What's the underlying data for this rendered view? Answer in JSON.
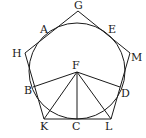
{
  "diagram": {
    "stroke_color": "#1a1a1a",
    "background": "#ffffff",
    "circle": {
      "center": [
        77,
        71
      ],
      "radius": 48
    },
    "pentagon": {
      "vertices": {
        "G": [
          78,
          11
        ],
        "M": [
          130,
          53
        ],
        "L": [
          111,
          119
        ],
        "K": [
          44,
          119
        ],
        "H": [
          25,
          53
        ]
      }
    },
    "points": {
      "A": [
        43,
        34
      ],
      "E": [
        111,
        34
      ],
      "D": [
        120,
        87
      ],
      "C": [
        77,
        119
      ],
      "B": [
        33,
        87
      ],
      "F": [
        77,
        72
      ]
    },
    "segments": [
      [
        "F",
        "B"
      ],
      [
        "F",
        "K"
      ],
      [
        "F",
        "C"
      ],
      [
        "F",
        "L"
      ],
      [
        "F",
        "D"
      ]
    ],
    "labels": [
      {
        "text": "G",
        "x": 74,
        "y": 9
      },
      {
        "text": "A",
        "x": 40,
        "y": 33
      },
      {
        "text": "E",
        "x": 108,
        "y": 33
      },
      {
        "text": "H",
        "x": 12,
        "y": 57
      },
      {
        "text": "M",
        "x": 131,
        "y": 61
      },
      {
        "text": "F",
        "x": 72,
        "y": 69
      },
      {
        "text": "B",
        "x": 24,
        "y": 94
      },
      {
        "text": "D",
        "x": 121,
        "y": 97
      },
      {
        "text": "K",
        "x": 40,
        "y": 130
      },
      {
        "text": "C",
        "x": 72,
        "y": 130
      },
      {
        "text": "L",
        "x": 105,
        "y": 130
      }
    ]
  }
}
